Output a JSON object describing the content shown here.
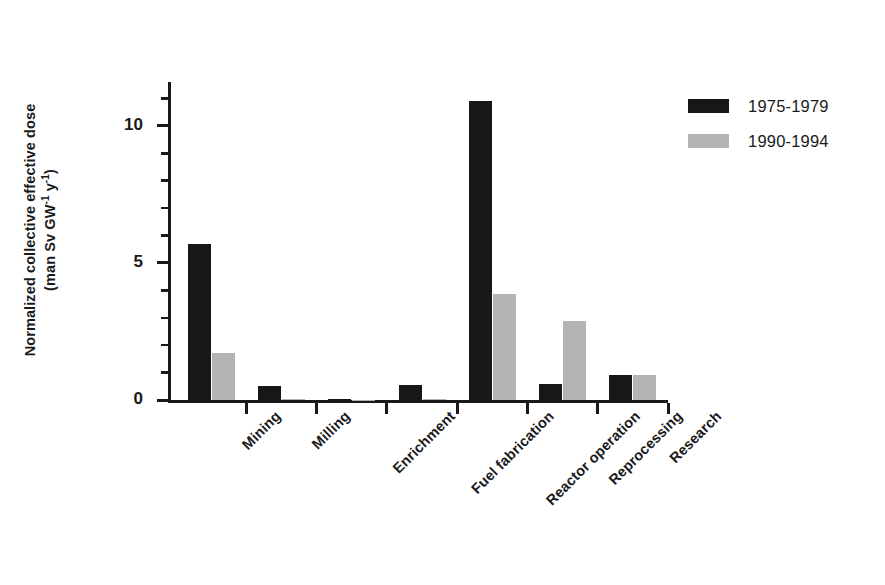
{
  "chart_data": {
    "type": "bar",
    "title": "",
    "subtitle": "",
    "xlabel": "",
    "ylabel_line1": "Normalized collective effective dose",
    "ylabel_line2_pre": "(man Sv GW",
    "ylabel_line2_sup1": "-1",
    "ylabel_line2_mid": " y",
    "ylabel_line2_sup2": "-1",
    "ylabel_line2_post": ")",
    "ylabel_plain": "Normalized collective effective dose (man Sv GW-1 y-1)",
    "categories": [
      "Mining",
      "Milling",
      "Enrichment",
      "Fuel fabrication",
      "Reactor operation",
      "Reprocessing",
      "Research"
    ],
    "series": [
      {
        "name": "1975-1979",
        "color": "#171717",
        "values": [
          5.7,
          0.5,
          0.02,
          0.55,
          10.9,
          0.6,
          0.9
        ]
      },
      {
        "name": "1990-1994",
        "color": "#b3b3b3",
        "values": [
          1.7,
          0.05,
          0.01,
          0.03,
          3.85,
          2.9,
          0.9
        ]
      }
    ],
    "ylim": [
      0,
      11.6
    ],
    "ytick_major": [
      0,
      5,
      10
    ],
    "ytick_major_labels": [
      "0",
      "5",
      "10"
    ],
    "ytick_minor": [
      1,
      2,
      3,
      4,
      6,
      7,
      8,
      9,
      11
    ],
    "grid": false,
    "legend_position": "right-top",
    "axis_color": "#1a1a1a",
    "background": "#ffffff"
  },
  "legend": {
    "items": [
      {
        "label": "1975-1979",
        "swatch": "sw-a"
      },
      {
        "label": "1990-1994",
        "swatch": "sw-b"
      }
    ]
  }
}
